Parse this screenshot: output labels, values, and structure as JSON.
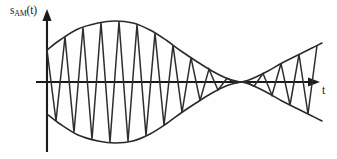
{
  "figure": {
    "kind": "amplitude-modulation-waveform",
    "background_color": "#fefefe",
    "ink_color": "#1d1d1d",
    "width": 337,
    "height": 159
  },
  "axes": {
    "y_label": "s",
    "y_label_subscript": "AM",
    "y_label_suffix": "(t)",
    "y_label_full": "s_AM(t)",
    "x_label": "t",
    "origin_x": 47,
    "baseline_y": 82,
    "y_axis_top": 12,
    "y_axis_bottom": 152,
    "x_axis_right": 318,
    "arrow_size": 7
  },
  "chart_data": {
    "type": "line",
    "title": "",
    "xlabel": "t",
    "ylabel": "s_AM(t)",
    "grid": false,
    "legend": false,
    "xlim": [
      47,
      330
    ],
    "ylim": [
      152,
      12
    ],
    "baseline": 82,
    "envelope": {
      "description": "Upper envelope control points in pixel coords (x, y). Lower envelope is the mirror about the baseline.",
      "upper_points": [
        [
          47,
          50
        ],
        [
          60,
          40
        ],
        [
          78,
          29
        ],
        [
          98,
          23
        ],
        [
          115,
          21
        ],
        [
          133,
          23
        ],
        [
          150,
          30
        ],
        [
          166,
          40
        ],
        [
          181,
          51
        ],
        [
          196,
          61
        ],
        [
          212,
          71
        ],
        [
          226,
          78
        ],
        [
          236,
          81
        ],
        [
          240,
          82
        ],
        [
          246,
          81
        ],
        [
          256,
          77
        ],
        [
          268,
          71
        ],
        [
          282,
          63
        ],
        [
          298,
          55
        ],
        [
          312,
          48
        ],
        [
          322,
          43
        ]
      ],
      "lower_points": [
        [
          47,
          114
        ],
        [
          60,
          124
        ],
        [
          78,
          135
        ],
        [
          98,
          141
        ],
        [
          115,
          143
        ],
        [
          133,
          141
        ],
        [
          150,
          134
        ],
        [
          166,
          124
        ],
        [
          181,
          113
        ],
        [
          196,
          103
        ],
        [
          212,
          93
        ],
        [
          226,
          86
        ],
        [
          236,
          83
        ],
        [
          240,
          82
        ],
        [
          246,
          83
        ],
        [
          256,
          87
        ],
        [
          268,
          93
        ],
        [
          282,
          101
        ],
        [
          298,
          109
        ],
        [
          312,
          116
        ],
        [
          322,
          121
        ]
      ],
      "null_x": 240,
      "peak_x": 115,
      "peak_upper_y": 21,
      "peak_lower_y": 143
    },
    "carrier": {
      "description": "Triangular carrier peaks alternate between the upper and lower envelope; x positions of successive extrema in pixel coords.",
      "extrema_x": [
        47,
        56,
        65,
        74,
        83,
        92,
        101,
        110,
        119,
        128,
        137,
        146,
        155,
        164,
        173,
        182,
        191,
        200,
        209,
        218,
        227,
        236,
        245,
        254,
        263,
        272,
        281,
        290,
        299,
        308,
        317
      ],
      "start_polarity": "up",
      "cycle_count_left": 10,
      "cycle_count_right": 3,
      "half_period_px": 9
    }
  }
}
